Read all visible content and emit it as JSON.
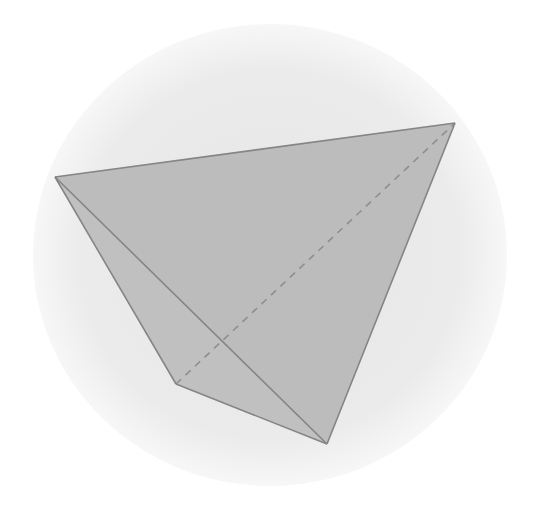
{
  "figure": {
    "colors": {
      "background": "#ffffff",
      "circle": "#ececec",
      "circle_edge": "#f6f6f6",
      "face_fill": "#bcbcbc",
      "face_fill_front": "#c4c4c4",
      "edge": "#858585",
      "hidden_edge": "#8e8e8e"
    },
    "circle": {
      "cx": 270,
      "cy": 255,
      "rx": 237,
      "ry": 231
    },
    "vertices": {
      "A": {
        "x": 55,
        "y": 177
      },
      "B": {
        "x": 455,
        "y": 123
      },
      "C": {
        "x": 176,
        "y": 384
      },
      "D": {
        "x": 327,
        "y": 444
      }
    },
    "solid_edges": [
      "A-B",
      "B-D",
      "A-D",
      "A-C",
      "C-D"
    ],
    "hidden_edges": [
      "C-B"
    ]
  }
}
